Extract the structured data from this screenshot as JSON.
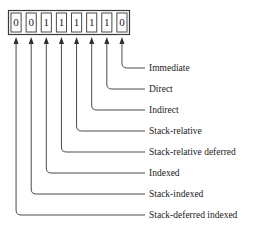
{
  "diagram": {
    "bit_field": {
      "bits": [
        "0",
        "0",
        "1",
        "1",
        "1",
        "1",
        "1",
        "0"
      ],
      "bit_count": 8
    },
    "labels": [
      {
        "text": "Immediate"
      },
      {
        "text": "Direct"
      },
      {
        "text": "Indirect"
      },
      {
        "text": "Stack-relative"
      },
      {
        "text": "Stack-relative deferred"
      },
      {
        "text": "Indexed"
      },
      {
        "text": "Stack-indexed"
      },
      {
        "text": "Stack-deferred indexed"
      }
    ],
    "colors": {
      "background": "#ffffff",
      "line": "#4a4a4a",
      "text": "#1a1a1a",
      "arrow": "#2b2b2b"
    }
  }
}
